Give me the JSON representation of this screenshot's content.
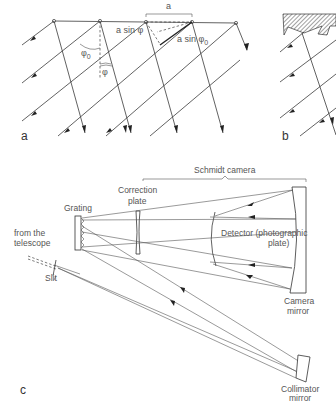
{
  "figure": {
    "panels": [
      {
        "id": "a",
        "label": "a",
        "description": "Plane wave diffraction at grating slits"
      },
      {
        "id": "b",
        "label": "b",
        "description": "Blazed (sawtooth) reflection grating"
      },
      {
        "id": "c",
        "label": "c",
        "description": "Spectrograph with Schmidt camera"
      }
    ],
    "panel_a": {
      "spacing_label": "a",
      "path_diff_out": "a sin φ",
      "path_diff_in": "a sin φ",
      "path_diff_in_sub": "0",
      "angle_in": "φ",
      "angle_in_sub": "0",
      "angle_out": "φ"
    },
    "panel_c": {
      "schmidt_camera": "Schmidt camera",
      "correction_plate_line1": "Correction",
      "correction_plate_line2": "plate",
      "grating": "Grating",
      "from_telescope_line1": "from the",
      "from_telescope_line2": "telescope",
      "slit": "Slit",
      "detector_line1": "Detector (photographic",
      "detector_line2": "plate)",
      "camera_mirror_line1": "Camera",
      "camera_mirror_line2": "mirror",
      "collimator_line1": "Collimator",
      "collimator_line2": "mirror"
    }
  }
}
